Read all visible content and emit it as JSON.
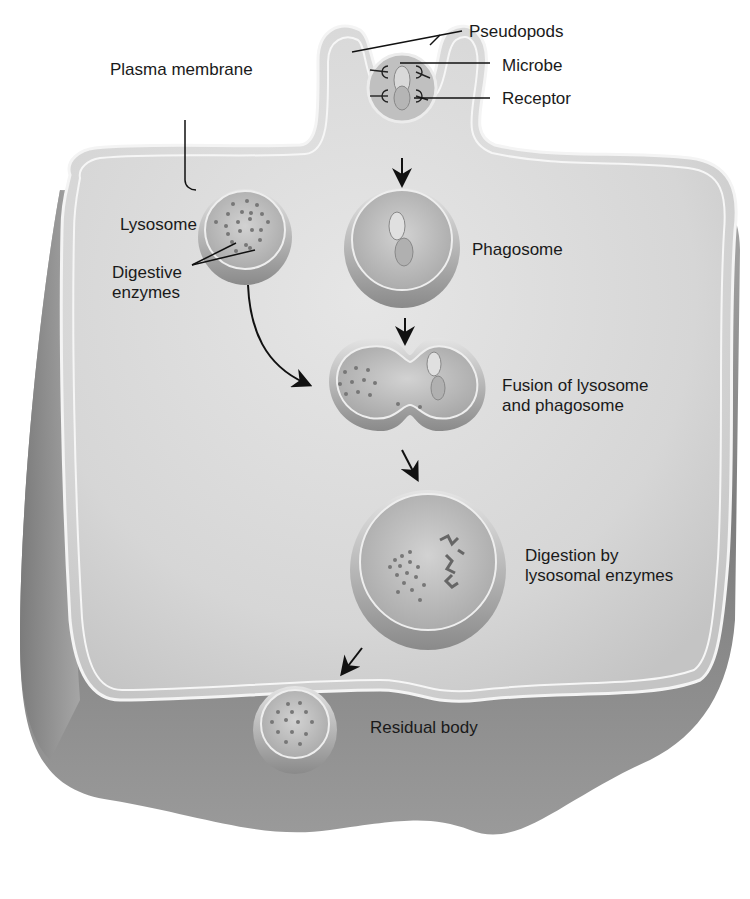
{
  "diagram": {
    "colors": {
      "background": "#ffffff",
      "cell_fill": "#dcdcdc",
      "cell_side": "#8e8e8e",
      "membrane": "#f2f2f2",
      "vesicle_fill": "#c8c8c8",
      "leader_line": "#111111",
      "text": "#1a1a1a"
    },
    "labels": {
      "plasma_membrane": "Plasma membrane",
      "pseudopods": "Pseudopods",
      "microbe": "Microbe",
      "receptor": "Receptor",
      "lysosome": "Lysosome",
      "digestive_enzymes_1": "Digestive",
      "digestive_enzymes_2": "enzymes",
      "phagosome": "Phagosome",
      "fusion_1": "Fusion of lysosome",
      "fusion_2": "and phagosome",
      "digestion_1": "Digestion by",
      "digestion_2": "lysosomal enzymes",
      "residual_body": "Residual body"
    },
    "stages": [
      {
        "step": 1,
        "name": "Pseudopods engulf microbe bound to receptors"
      },
      {
        "step": 2,
        "name": "Phagosome"
      },
      {
        "step": 3,
        "name": "Fusion of lysosome and phagosome"
      },
      {
        "step": 4,
        "name": "Digestion by lysosomal enzymes"
      },
      {
        "step": 5,
        "name": "Residual body"
      }
    ]
  }
}
